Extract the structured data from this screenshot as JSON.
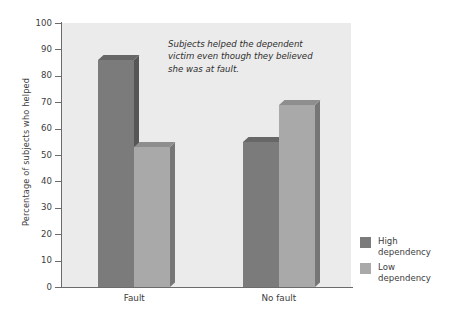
{
  "chart_data": {
    "type": "bar",
    "title": "",
    "xlabel": "",
    "ylabel": "Percentage of subjects who helped",
    "categories": [
      "Fault",
      "No fault"
    ],
    "series": [
      {
        "name": "High dependency",
        "values": [
          86,
          55
        ],
        "color": "#7b7b7b"
      },
      {
        "name": "Low dependency",
        "values": [
          53,
          69
        ],
        "color": "#a9a9a9"
      }
    ],
    "ylim": [
      0,
      100
    ],
    "yticks": [
      0,
      10,
      20,
      30,
      40,
      50,
      60,
      70,
      80,
      90,
      100
    ],
    "ytick_labels": [
      "0",
      "10",
      "20",
      "30",
      "40",
      "50",
      "60",
      "70",
      "80",
      "90",
      "100"
    ],
    "grid": false,
    "legend_position": "right-bottom",
    "plot_background": "#ebebeb",
    "annotations": [
      {
        "text": "Subjects helped the dependent victim even though they believed she was at fault.",
        "style": "italic"
      }
    ]
  },
  "legend": {
    "items": [
      {
        "label_line1": "High",
        "label_line2": "dependency",
        "color": "#7b7b7b"
      },
      {
        "label_line1": "Low",
        "label_line2": "dependency",
        "color": "#a9a9a9"
      }
    ]
  }
}
